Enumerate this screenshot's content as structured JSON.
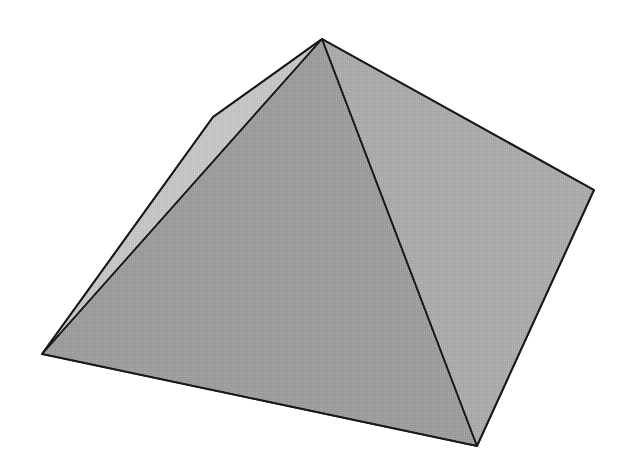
{
  "figure": {
    "subject": "square pyramid",
    "background": "#ffffff",
    "edge_color": "#1a1a1a",
    "vertices": {
      "apex": [
        322,
        39
      ],
      "left_shoulder": [
        213,
        117
      ],
      "left_corner": [
        42,
        354
      ],
      "bottom_corner": [
        477,
        446
      ],
      "right_corner": [
        594,
        190
      ]
    },
    "faces": [
      {
        "name": "left-face",
        "fill": "#c6c6c6",
        "points": "322,39 213,117 42,354"
      },
      {
        "name": "front-face",
        "fill": "#9d9d9d",
        "points": "322,39 42,354 477,446"
      },
      {
        "name": "right-face",
        "fill": "#ababab",
        "points": "322,39 477,446 594,190"
      }
    ]
  }
}
